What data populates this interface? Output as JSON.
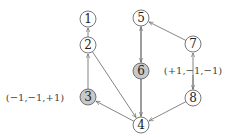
{
  "diagram": {
    "type": "directed-graph",
    "nodes": [
      {
        "id": "1",
        "label": "1",
        "x": 88,
        "y": 19,
        "shaded": false
      },
      {
        "id": "2",
        "label": "2",
        "x": 88,
        "y": 45,
        "shaded": false
      },
      {
        "id": "3",
        "label": "3",
        "x": 88,
        "y": 97,
        "shaded": true
      },
      {
        "id": "4",
        "label": "4",
        "x": 141,
        "y": 125,
        "shaded": false
      },
      {
        "id": "5",
        "label": "5",
        "x": 141,
        "y": 18,
        "shaded": false
      },
      {
        "id": "6",
        "label": "6",
        "x": 141,
        "y": 71,
        "shaded": true
      },
      {
        "id": "7",
        "label": "7",
        "x": 193,
        "y": 44,
        "shaded": false
      },
      {
        "id": "8",
        "label": "8",
        "x": 193,
        "y": 98,
        "shaded": false
      }
    ],
    "edges": [
      {
        "from": "2",
        "to": "1"
      },
      {
        "from": "3",
        "to": "2"
      },
      {
        "from": "2",
        "to": "4"
      },
      {
        "from": "5",
        "to": "6"
      },
      {
        "from": "6",
        "to": "4"
      },
      {
        "from": "4",
        "to": "3"
      },
      {
        "from": "8",
        "to": "4"
      },
      {
        "from": "8",
        "to": "7"
      },
      {
        "from": "7",
        "to": "5"
      },
      {
        "from": "4",
        "to": "5"
      },
      {
        "from": "annotation-right",
        "to": "8"
      }
    ],
    "annotations": [
      {
        "id": "annotation-left",
        "text": "(−1,−1,+1)",
        "x": 35,
        "y": 101
      },
      {
        "id": "annotation-right",
        "text": "(+1,−1,−1)",
        "x": 193,
        "y": 74
      }
    ],
    "colors": {
      "node_fill": "#ffffff",
      "shaded_fill": "#c8c8c8",
      "stroke": "#555555",
      "edge": "#666666"
    }
  }
}
